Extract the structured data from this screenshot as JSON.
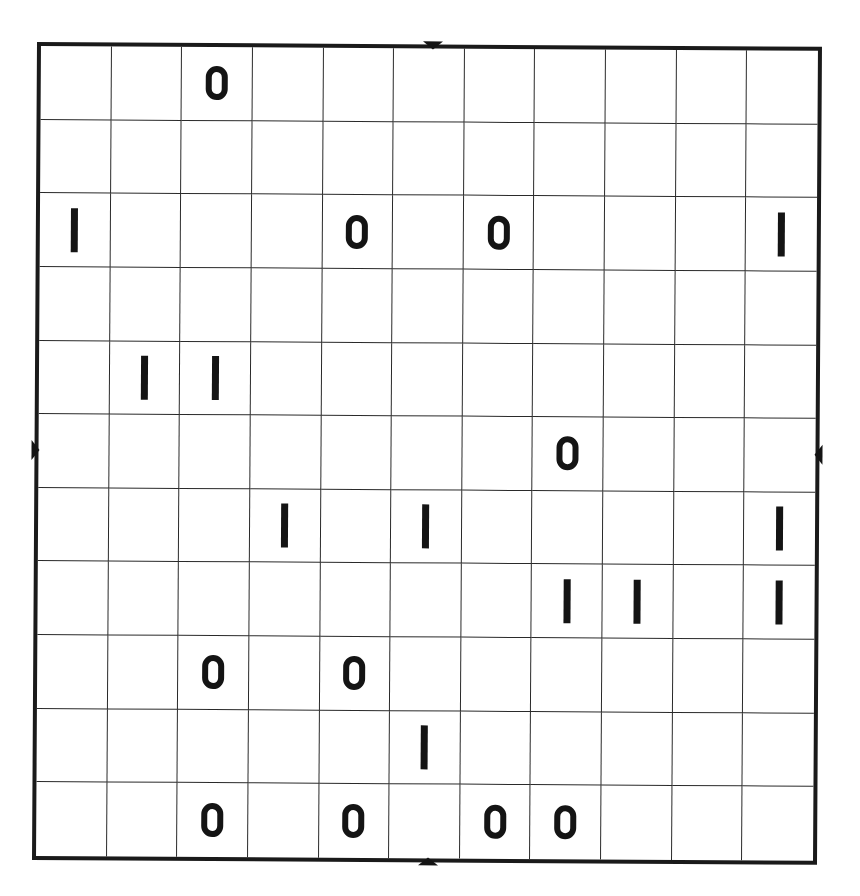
{
  "puzzle": {
    "type": "binary-takuzu",
    "rows": 11,
    "cols": 11,
    "symbols": {
      "zero": "0",
      "one": "1"
    },
    "grid": [
      [
        "",
        "",
        "0",
        "",
        "",
        "",
        "",
        "",
        "",
        "",
        ""
      ],
      [
        "",
        "",
        "",
        "",
        "",
        "",
        "",
        "",
        "",
        "",
        ""
      ],
      [
        "1",
        "",
        "",
        "",
        "0",
        "",
        "0",
        "",
        "",
        "",
        "1"
      ],
      [
        "",
        "",
        "",
        "",
        "",
        "",
        "",
        "",
        "",
        "",
        ""
      ],
      [
        "",
        "1",
        "1",
        "",
        "",
        "",
        "",
        "",
        "",
        "",
        ""
      ],
      [
        "",
        "",
        "",
        "",
        "",
        "",
        "",
        "0",
        "",
        "",
        ""
      ],
      [
        "",
        "",
        "",
        "1",
        "",
        "1",
        "",
        "",
        "",
        "",
        "1"
      ],
      [
        "",
        "",
        "",
        "",
        "",
        "",
        "",
        "1",
        "1",
        "",
        "1"
      ],
      [
        "",
        "",
        "0",
        "",
        "0",
        "",
        "",
        "",
        "",
        "",
        ""
      ],
      [
        "",
        "",
        "",
        "",
        "",
        "1",
        "",
        "",
        "",
        "",
        ""
      ],
      [
        "",
        "",
        "0",
        "",
        "0",
        "",
        "0",
        "0",
        "",
        "",
        ""
      ]
    ],
    "center_markers": [
      "top",
      "bottom",
      "left",
      "right"
    ]
  },
  "colors": {
    "ink": "#141414",
    "grid_line": "#2a2a2a",
    "border": "#1a1a1a",
    "background": "#ffffff"
  }
}
